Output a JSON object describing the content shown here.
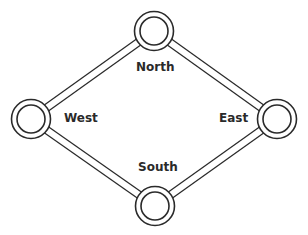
{
  "diagram": {
    "type": "ring-network",
    "nodes": [
      {
        "id": "north",
        "label": "North",
        "x": 154,
        "y": 31
      },
      {
        "id": "east",
        "label": "East",
        "x": 277,
        "y": 119
      },
      {
        "id": "south",
        "label": "South",
        "x": 155,
        "y": 206
      },
      {
        "id": "west",
        "label": "West",
        "x": 31,
        "y": 119
      }
    ],
    "edges": [
      [
        "north",
        "east"
      ],
      [
        "east",
        "south"
      ],
      [
        "south",
        "west"
      ],
      [
        "west",
        "north"
      ]
    ],
    "colors": {
      "stroke": "#2a2a2a",
      "background": "#ffffff"
    }
  }
}
